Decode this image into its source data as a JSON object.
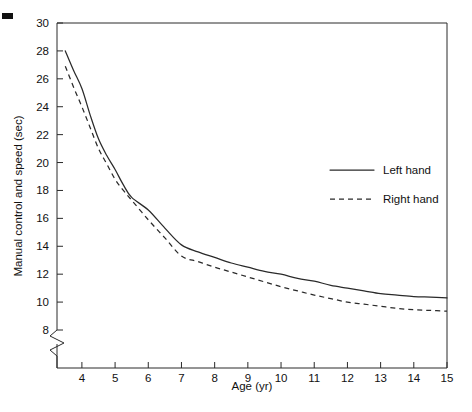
{
  "figure": {
    "corner_mark_name": "page-corner-mark",
    "background_color": "#ffffff",
    "ink_color": "#2a2a2a"
  },
  "chart_data": {
    "type": "line",
    "title": "",
    "xlabel": "Age (yr)",
    "ylabel": "Manual control and speed (sec)",
    "xlim": [
      3.25,
      15
    ],
    "ylim": [
      7.2,
      30
    ],
    "xticks": [
      4,
      5,
      6,
      7,
      8,
      9,
      10,
      11,
      12,
      13,
      14,
      15
    ],
    "yticks": [
      8,
      10,
      12,
      14,
      16,
      18,
      20,
      22,
      24,
      26,
      28,
      30
    ],
    "xtick_labels": [
      "4",
      "5",
      "6",
      "7",
      "8",
      "9",
      "10",
      "11",
      "12",
      "13",
      "14",
      "15"
    ],
    "ytick_labels": [
      "8",
      "10",
      "12",
      "14",
      "16",
      "18",
      "20",
      "22",
      "24",
      "26",
      "28",
      "30"
    ],
    "grid": false,
    "y_axis_break": true,
    "y_axis_break_note": "zigzag break on y-axis below the 8 tick",
    "legend_position": "upper right inside",
    "x": [
      3.5,
      3.75,
      4,
      4.25,
      4.5,
      4.75,
      5,
      5.25,
      5.5,
      6,
      6.5,
      7,
      7.5,
      8,
      8.5,
      9,
      9.5,
      10,
      10.5,
      11,
      11.5,
      12,
      12.5,
      13,
      13.5,
      14,
      14.5,
      15
    ],
    "series": [
      {
        "name": "Left hand",
        "style": "solid",
        "values": [
          28.0,
          26.6,
          25.3,
          23.4,
          21.7,
          20.5,
          19.5,
          18.4,
          17.5,
          16.6,
          15.3,
          14.1,
          13.6,
          13.2,
          12.8,
          12.5,
          12.2,
          12.0,
          11.7,
          11.5,
          11.2,
          11.0,
          10.8,
          10.6,
          10.5,
          10.4,
          10.35,
          10.3
        ]
      },
      {
        "name": "Right hand",
        "style": "dashed",
        "values": [
          26.9,
          25.4,
          24.0,
          22.5,
          21.0,
          19.9,
          18.8,
          18.0,
          17.3,
          15.9,
          14.6,
          13.3,
          12.9,
          12.5,
          12.15,
          11.8,
          11.45,
          11.1,
          10.8,
          10.5,
          10.25,
          10.0,
          9.85,
          9.7,
          9.55,
          9.45,
          9.4,
          9.35
        ]
      }
    ],
    "legend": [
      {
        "label": "Left hand",
        "style": "solid"
      },
      {
        "label": "Right hand",
        "style": "dashed"
      }
    ]
  }
}
